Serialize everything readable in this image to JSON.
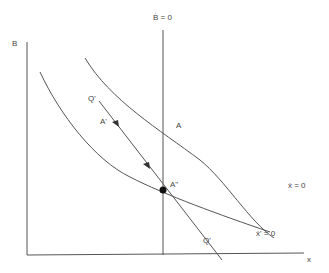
{
  "diagram": {
    "y_axis_label": "B",
    "x_axis_label": "x",
    "vertical_line_label": "Ḃ = 0",
    "outer_curve_label": "ẋ = 0",
    "inner_curve_label": "ẋ' = 0",
    "point_A": "A",
    "point_A_prime": "A'",
    "point_A_double_prime": "A''",
    "path_start_label": "Q'",
    "path_end_label": "Q'",
    "colors": {
      "line": "#555555",
      "point": "#111111",
      "text": "#444444"
    }
  }
}
